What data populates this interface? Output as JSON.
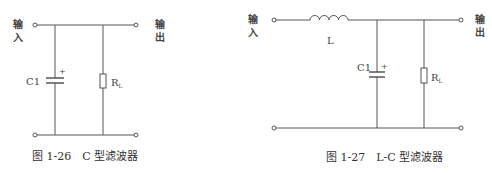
{
  "figures": [
    {
      "id": "fig-1-26",
      "caption": "图 1-26　C 型滤波器",
      "input_label_line1": "输",
      "input_label_line2": "入",
      "output_label_line1": "输",
      "output_label_line2": "出",
      "components": {
        "capacitor": {
          "label": "C1",
          "polarity": "+"
        },
        "resistor": {
          "label": "R",
          "subscript": "L"
        }
      }
    },
    {
      "id": "fig-1-27",
      "caption": "图 1-27　L-C 型滤波器",
      "input_label_line1": "输",
      "input_label_line2": "入",
      "output_label_line1": "输",
      "output_label_line2": "出",
      "components": {
        "inductor": {
          "label": "L"
        },
        "capacitor": {
          "label": "C1",
          "polarity": "+"
        },
        "resistor": {
          "label": "R",
          "subscript": "L"
        }
      }
    }
  ]
}
